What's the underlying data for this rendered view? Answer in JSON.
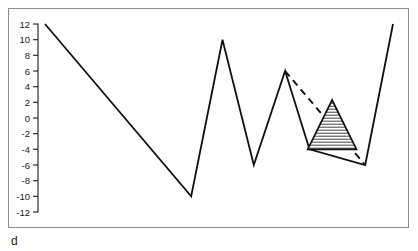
{
  "figure": {
    "panel_label": "d",
    "frame_color": "#8c8c8c",
    "line_color": "#111111",
    "background": "#ffffff"
  },
  "chart_data": {
    "type": "line",
    "title": "",
    "subtitle": "",
    "xlabel": "",
    "ylabel": "",
    "panel_label": "d",
    "xlim": [
      0,
      10
    ],
    "ylim": [
      -13,
      13
    ],
    "grid": false,
    "legend": null,
    "x_axis_visible": false,
    "y_ticks": [
      12,
      10,
      8,
      6,
      4,
      2,
      0,
      -2,
      -4,
      -6,
      -8,
      -10,
      -12
    ],
    "y_tick_labels": [
      "12",
      "10",
      "8",
      "6",
      "4",
      "2",
      "0",
      "-2",
      "-4",
      "-6",
      "-8",
      "-10",
      "-12"
    ],
    "series": [
      {
        "name": "signal",
        "style": "solid",
        "x": [
          0.0,
          4.2,
          5.1,
          6.0,
          6.9,
          7.6,
          9.2,
          10.0
        ],
        "values": [
          12,
          -10,
          10,
          -6,
          6,
          -4,
          -6,
          12
        ]
      },
      {
        "name": "projection",
        "style": "dashed",
        "x": [
          6.9,
          9.2
        ],
        "values": [
          6,
          -6
        ]
      }
    ],
    "annotations": [
      {
        "name": "hatched-triangle",
        "shape": "triangle",
        "hatch": "horizontal",
        "x": [
          7.55,
          8.25,
          8.95
        ],
        "values": [
          -4,
          2.3,
          -4
        ]
      }
    ]
  }
}
